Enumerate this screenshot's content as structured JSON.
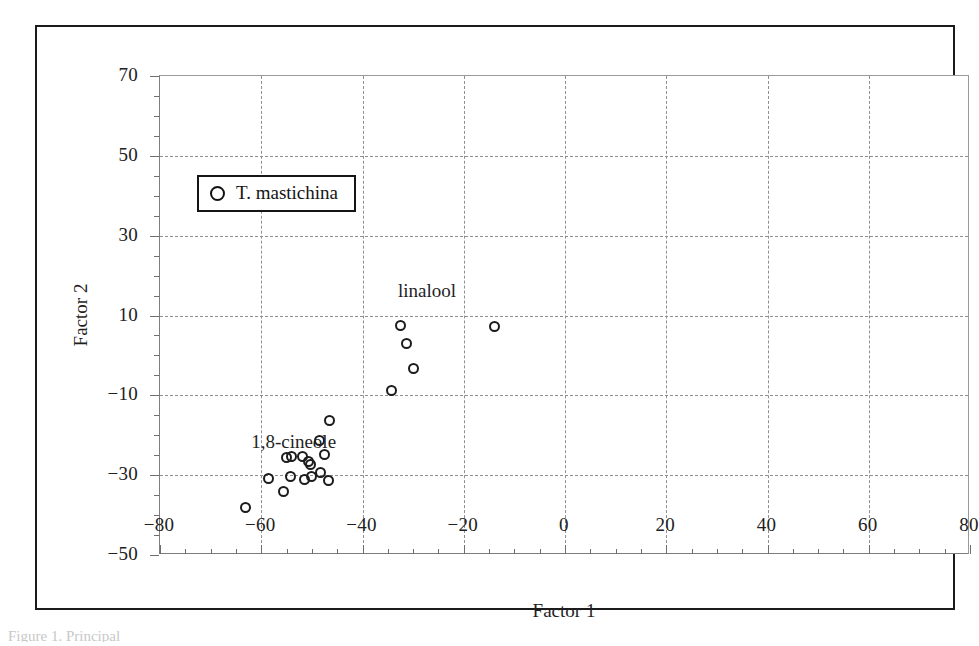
{
  "figure": {
    "title": "Section Mastichina",
    "caption": "Figure 1. Principal"
  },
  "legend": {
    "marker_icon": "open-circle-marker",
    "label": "T. mastichina"
  },
  "annotations": [
    {
      "text": "linalool",
      "x": -33,
      "y": 19
    },
    {
      "text": "1,8-cineole",
      "x": -62,
      "y": -19
    }
  ],
  "chart_data": {
    "type": "scatter",
    "title": "Section Mastichina",
    "xlabel": "Factor 1",
    "ylabel": "Factor 2",
    "xlim": [
      -80,
      80
    ],
    "ylim": [
      -50,
      70
    ],
    "xticks": [
      -80,
      -60,
      -40,
      -20,
      0,
      20,
      40,
      60,
      80
    ],
    "yticks": [
      -50,
      -30,
      -10,
      10,
      30,
      50,
      70
    ],
    "xtick_labels": [
      "−80",
      "−60",
      "−40",
      "−20",
      "0",
      "20",
      "40",
      "60",
      "80"
    ],
    "ytick_labels": [
      "−50",
      "−30",
      "−10",
      "10",
      "30",
      "50",
      "70"
    ],
    "minor_tick_step": 5,
    "grid": "dashed gridlines at major ticks",
    "legend_position": "upper-left inside axes",
    "marker_style": "open circle",
    "series": [
      {
        "name": "T. mastichina",
        "points": [
          [
            -34.2,
            -8.9
          ],
          [
            -32.5,
            7.4
          ],
          [
            -31.3,
            3.0
          ],
          [
            -30.0,
            -3.4
          ],
          [
            -14.0,
            7.3
          ],
          [
            -46.5,
            -16.3
          ],
          [
            -48.4,
            -21.4
          ],
          [
            -55.0,
            -25.6
          ],
          [
            -54.0,
            -25.4
          ],
          [
            -51.8,
            -25.3
          ],
          [
            -50.6,
            -26.6
          ],
          [
            -50.2,
            -27.3
          ],
          [
            -47.6,
            -24.9
          ],
          [
            -58.5,
            -30.9
          ],
          [
            -54.2,
            -30.3
          ],
          [
            -51.5,
            -31.1
          ],
          [
            -50.0,
            -30.3
          ],
          [
            -48.2,
            -29.3
          ],
          [
            -46.8,
            -31.3
          ],
          [
            -55.7,
            -34.2
          ],
          [
            -63.2,
            -38.0
          ]
        ]
      }
    ]
  }
}
